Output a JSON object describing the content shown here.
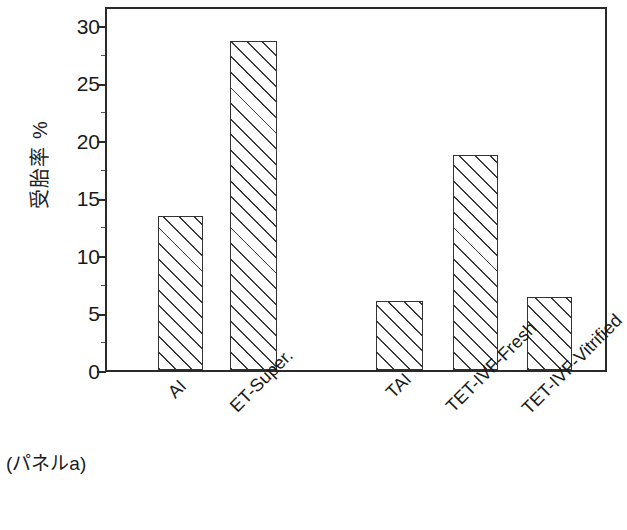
{
  "chart_data": {
    "type": "bar",
    "title": "",
    "subtitle": "",
    "xlabel": "",
    "ylabel": "受胎率 %",
    "categories": [
      "AI",
      "ET-Super.",
      "TAI",
      "TET-IVF-Fresh",
      "TET-IVF-Vitrified"
    ],
    "values": [
      13.6,
      29.0,
      6.1,
      18.9,
      6.4
    ],
    "ylim": [
      0,
      31.8
    ],
    "ytick_labels": [
      "0",
      "5",
      "10",
      "15",
      "20",
      "25",
      "30"
    ],
    "ytick_values": [
      0,
      5,
      10,
      15,
      20,
      25,
      30
    ],
    "grid": false,
    "legend": null,
    "annotations": [
      "(パネルa)"
    ],
    "bar_fill": "diagonal-hatch",
    "bar_edge_color": "#333333",
    "plot_background": "#ffffff",
    "axis_color": "#2a2a2a"
  },
  "caption": {
    "text": "(パネルa)"
  },
  "figure": {
    "y_axis_title": "受胎率 %"
  }
}
